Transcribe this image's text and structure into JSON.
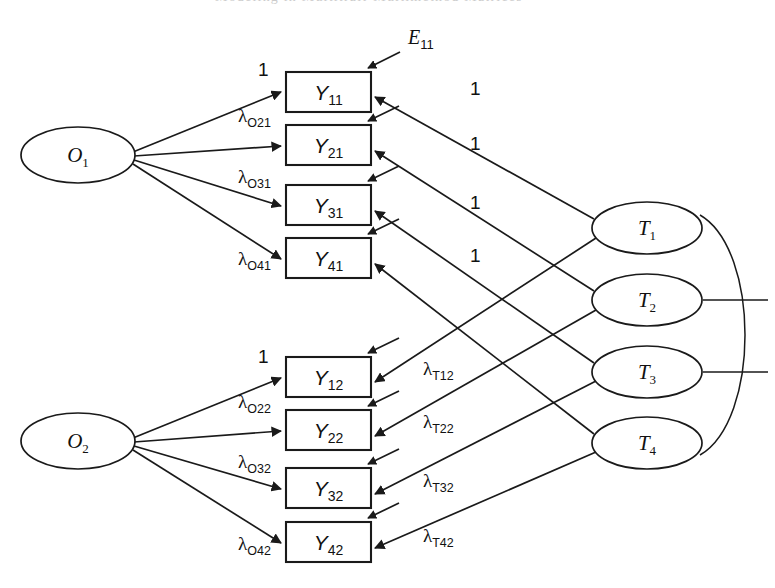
{
  "figure": {
    "header_bleed": "Modeling in Multitrait-Multimethod Matrices",
    "background_color": "#ffffff",
    "line_color": "#1a1a1a"
  },
  "occasion_factors": [
    {
      "id": "O1",
      "base": "O",
      "sub": "1",
      "cx": 78,
      "cy": 155,
      "rx": 57,
      "ry": 28
    },
    {
      "id": "O2",
      "base": "O",
      "sub": "2",
      "cx": 78,
      "cy": 441,
      "rx": 57,
      "ry": 28
    }
  ],
  "trait_factors": [
    {
      "id": "T1",
      "base": "T",
      "sub": "1",
      "cx": 647,
      "cy": 228,
      "rx": 55,
      "ry": 26
    },
    {
      "id": "T2",
      "base": "T",
      "sub": "2",
      "cx": 647,
      "cy": 300,
      "rx": 55,
      "ry": 26
    },
    {
      "id": "T3",
      "base": "T",
      "sub": "3",
      "cx": 647,
      "cy": 372,
      "rx": 55,
      "ry": 26
    },
    {
      "id": "T4",
      "base": "T",
      "sub": "4",
      "cx": 647,
      "cy": 443,
      "rx": 55,
      "ry": 26
    }
  ],
  "indicators": [
    {
      "id": "Y11",
      "base": "Y",
      "sub": "11",
      "x": 286,
      "y": 72,
      "w": 85,
      "h": 40,
      "block": "upper"
    },
    {
      "id": "Y21",
      "base": "Y",
      "sub": "21",
      "x": 286,
      "y": 125,
      "w": 85,
      "h": 40,
      "block": "upper"
    },
    {
      "id": "Y31",
      "base": "Y",
      "sub": "31",
      "x": 286,
      "y": 185,
      "w": 85,
      "h": 40,
      "block": "upper"
    },
    {
      "id": "Y41",
      "base": "Y",
      "sub": "41",
      "x": 286,
      "y": 238,
      "w": 85,
      "h": 40,
      "block": "upper"
    },
    {
      "id": "Y12",
      "base": "Y",
      "sub": "12",
      "x": 286,
      "y": 357,
      "w": 85,
      "h": 40,
      "block": "lower"
    },
    {
      "id": "Y22",
      "base": "Y",
      "sub": "22",
      "x": 286,
      "y": 410,
      "w": 85,
      "h": 40,
      "block": "lower"
    },
    {
      "id": "Y32",
      "base": "Y",
      "sub": "32",
      "x": 286,
      "y": 468,
      "w": 85,
      "h": 40,
      "block": "lower"
    },
    {
      "id": "Y42",
      "base": "Y",
      "sub": "42",
      "x": 286,
      "y": 522,
      "w": 85,
      "h": 40,
      "block": "lower"
    }
  ],
  "occasion_loadings": [
    {
      "from": "O1",
      "to": "Y11",
      "label": "1",
      "lambda": false,
      "lx": 258,
      "ly": 76
    },
    {
      "from": "O1",
      "to": "Y21",
      "label": "λ",
      "sub": "O21",
      "lambda": true,
      "lx": 238,
      "ly": 122
    },
    {
      "from": "O1",
      "to": "Y31",
      "label": "λ",
      "sub": "O31",
      "lambda": true,
      "lx": 238,
      "ly": 183
    },
    {
      "from": "O1",
      "to": "Y41",
      "label": "λ",
      "sub": "O41",
      "lambda": true,
      "lx": 238,
      "ly": 265
    },
    {
      "from": "O2",
      "to": "Y12",
      "label": "1",
      "lambda": false,
      "lx": 258,
      "ly": 363
    },
    {
      "from": "O2",
      "to": "Y22",
      "label": "λ",
      "sub": "O22",
      "lambda": true,
      "lx": 238,
      "ly": 408
    },
    {
      "from": "O2",
      "to": "Y32",
      "label": "λ",
      "sub": "O32",
      "lambda": true,
      "lx": 238,
      "ly": 468
    },
    {
      "from": "O2",
      "to": "Y42",
      "label": "λ",
      "sub": "O42",
      "lambda": true,
      "lx": 238,
      "ly": 550
    }
  ],
  "trait_loadings": [
    {
      "from": "T1",
      "to": "Y11",
      "label": "1",
      "lambda": false,
      "lx": 470,
      "ly": 95
    },
    {
      "from": "T2",
      "to": "Y21",
      "label": "1",
      "lambda": false,
      "lx": 470,
      "ly": 150
    },
    {
      "from": "T3",
      "to": "Y31",
      "label": "1",
      "lambda": false,
      "lx": 470,
      "ly": 209
    },
    {
      "from": "T4",
      "to": "Y41",
      "label": "1",
      "lambda": false,
      "lx": 470,
      "ly": 262
    },
    {
      "from": "T1",
      "to": "Y12",
      "label": "λ",
      "sub": "T12",
      "lambda": true,
      "lx": 423,
      "ly": 375
    },
    {
      "from": "T2",
      "to": "Y22",
      "label": "λ",
      "sub": "T22",
      "lambda": true,
      "lx": 423,
      "ly": 428
    },
    {
      "from": "T3",
      "to": "Y32",
      "label": "λ",
      "sub": "T32",
      "lambda": true,
      "lx": 423,
      "ly": 487
    },
    {
      "from": "T4",
      "to": "Y42",
      "label": "λ",
      "sub": "T42",
      "lambda": true,
      "lx": 423,
      "ly": 542
    }
  ],
  "error_label": {
    "base": "E",
    "sub": "11",
    "x": 408,
    "y": 44
  },
  "trait_covariances": [
    {
      "type": "arc",
      "from": "T1",
      "to": "T4"
    },
    {
      "type": "stub",
      "from": "T2"
    },
    {
      "type": "stub",
      "from": "T3"
    }
  ]
}
